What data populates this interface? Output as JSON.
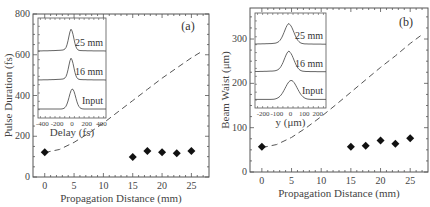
{
  "chart_data": [
    {
      "type": "scatter",
      "panel_label": "(a)",
      "title": "",
      "xlabel": "Propagation Distance (mm)",
      "ylabel": "Pulse Duration (fs)",
      "xlim": [
        -2,
        28
      ],
      "ylim": [
        0,
        800
      ],
      "xticks": [
        0,
        5,
        10,
        15,
        20,
        25
      ],
      "yticks": [
        0,
        200,
        400,
        600,
        800
      ],
      "grid": false,
      "series": [
        {
          "name": "measured",
          "style": "diamond-markers",
          "x": [
            0,
            15,
            17.5,
            20,
            22.5,
            25
          ],
          "y": [
            122,
            98,
            127,
            122,
            117,
            127
          ]
        },
        {
          "name": "linear-diffraction (dashed)",
          "style": "dashed-line",
          "x": [
            0,
            2.5,
            5,
            7.5,
            10,
            12.5,
            15,
            17.5,
            20,
            22.5,
            25,
            27
          ],
          "y": [
            120,
            135,
            170,
            215,
            265,
            320,
            375,
            430,
            485,
            535,
            585,
            620
          ]
        }
      ],
      "inset": {
        "xlabel": "Delay (fs)",
        "xticks": [
          -400,
          -200,
          0,
          200,
          400
        ],
        "traces": [
          "25 mm",
          "16 mm",
          "Input"
        ]
      }
    },
    {
      "type": "scatter",
      "panel_label": "(b)",
      "title": "",
      "xlabel": "Propagation Distance (mm)",
      "ylabel": "Beam Waist (μm)",
      "xlim": [
        -2,
        28
      ],
      "ylim": [
        0,
        370
      ],
      "xticks": [
        0,
        5,
        10,
        15,
        20,
        25
      ],
      "yticks": [
        0,
        100,
        200,
        300
      ],
      "grid": false,
      "series": [
        {
          "name": "measured",
          "style": "diamond-markers",
          "x": [
            0,
            15,
            17.5,
            20,
            22.5,
            25
          ],
          "y": [
            57,
            57,
            59,
            71,
            64,
            76
          ]
        },
        {
          "name": "linear-diffraction (dashed)",
          "style": "dashed-line",
          "x": [
            0,
            2.5,
            5,
            7.5,
            10,
            12.5,
            15,
            17.5,
            20,
            22.5,
            25,
            27
          ],
          "y": [
            55,
            62,
            78,
            100,
            125,
            152,
            180,
            208,
            236,
            262,
            290,
            310
          ]
        }
      ],
      "inset": {
        "xlabel": "y (μm)",
        "xticks": [
          -200,
          -100,
          0,
          100,
          200
        ],
        "traces": [
          "25 mm",
          "16 mm",
          "Input"
        ]
      }
    }
  ]
}
